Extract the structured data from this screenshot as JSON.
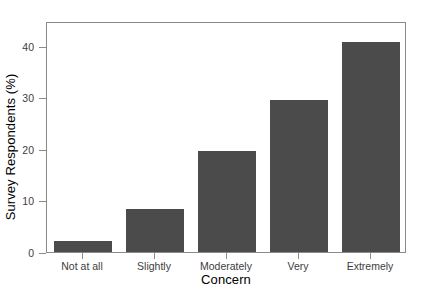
{
  "chart_data": {
    "type": "bar",
    "title": "",
    "subtitle": "",
    "xlabel": "Concern",
    "ylabel": "Survey Respondents (%)",
    "categories": [
      "Not at all",
      "Slightly",
      "Moderately",
      "Very",
      "Extremely"
    ],
    "values": [
      2.1,
      8.3,
      19.6,
      29.5,
      40.8
    ],
    "series": [
      {
        "name": "Survey Respondents (%)",
        "values": [
          2.1,
          8.3,
          19.6,
          29.5,
          40.8
        ]
      }
    ],
    "ylim": [
      0,
      44.8
    ],
    "xlim": [
      0.4,
      5.6
    ],
    "yticks": [
      0,
      10,
      20,
      30,
      40
    ],
    "yticklabels": [
      "0",
      "10",
      "20",
      "30",
      "40"
    ],
    "grid": false,
    "legend": false,
    "legend_position": "none",
    "bar_color": "#4b4b4b",
    "frame_color": "#8a8a8a",
    "background_color": "#ffffff",
    "tick_label_color": "#3d3d3d",
    "axis_title_color": "#000000"
  }
}
